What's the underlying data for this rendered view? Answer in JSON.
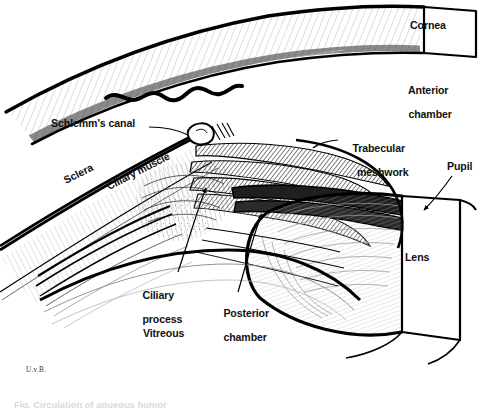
{
  "figure": {
    "domain": "anatomical-illustration",
    "style": "black-and-white pen-and-ink line drawing with cross-hatching",
    "background_color": "#ffffff",
    "ink_color": "#000000",
    "width": 488,
    "height": 408
  },
  "labels": {
    "schlemms_canal": "Schlemm's canal",
    "sclera": "Sclera",
    "ciliary_muscle": "Ciliary muscle",
    "cornea": "Cornea",
    "anterior_chamber_line1": "Anterior",
    "anterior_chamber_line2": "chamber",
    "trabecular_line1": "Trabecular",
    "trabecular_line2": "meshwork",
    "pupil": "Pupil",
    "lens": "Lens",
    "ciliary_process_line1": "Ciliary",
    "ciliary_process_line2": "process",
    "posterior_chamber_line1": "Posterior",
    "posterior_chamber_line2": "chamber",
    "vitreous": "Vitreous"
  },
  "signature": "U.v.B.",
  "caption": "Fig.  Circulation of aqueous humor",
  "structures": [
    {
      "name": "cornea",
      "description": "curved transparent dome sweeping from upper-left to the cut block at upper-right, shown in cross-section with fine parallel stromal lines"
    },
    {
      "name": "cornea-cut-face",
      "description": "white rectangular cut face at top right bearing the Cornea label"
    },
    {
      "name": "sclera",
      "description": "thick diagonal band running from lower-left to the limbus, filled with fine stippled hatching"
    },
    {
      "name": "conjunctival-cut-edge",
      "description": "thick wavy torn-edge line above the sclera indicating the tissue was cut away"
    },
    {
      "name": "schlemms-canal",
      "description": "small irregular oval lumen at the limbus with dense hatching beside it"
    },
    {
      "name": "trabecular-meshwork",
      "description": "wedge of dense cross-hatched lamellae at the iridocorneal angle"
    },
    {
      "name": "ciliary-muscle",
      "description": "triangular muscle mass with meridional fibre lines behind the scleral spur"
    },
    {
      "name": "ciliary-processes",
      "description": "row of finger-like heavily hatched ridges projecting toward the lens equator"
    },
    {
      "name": "iris",
      "description": "thick dark curved leaf extending from the angle to the pupil margin"
    },
    {
      "name": "pupil",
      "description": "aperture at the free margin of the iris"
    },
    {
      "name": "lens",
      "description": "large ellipse of concentric fibre arcs with a flat white cut face at the right"
    },
    {
      "name": "anterior-chamber",
      "description": "open space between cornea and iris"
    },
    {
      "name": "posterior-chamber",
      "description": "narrow space between iris, ciliary processes and lens"
    },
    {
      "name": "vitreous",
      "description": "region below and behind the lens"
    }
  ],
  "leader_lines": [
    {
      "from": "schlemms-canal-label",
      "to": "schlemms-canal"
    },
    {
      "from": "trabecular-meshwork-label",
      "to": "trabecular-meshwork"
    },
    {
      "from": "pupil-label",
      "to": "pupil",
      "arrow": true
    },
    {
      "from": "ciliary-process-label",
      "to": "ciliary-processes"
    },
    {
      "from": "posterior-chamber-label",
      "to": "posterior-chamber",
      "arrow": true
    }
  ]
}
